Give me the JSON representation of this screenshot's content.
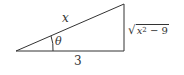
{
  "figure": {
    "type": "right-triangle",
    "labels": {
      "hypotenuse": "x",
      "angle": "θ",
      "adjacent": "3",
      "opposite_symbol": "√",
      "opposite_base": "x",
      "opposite_exp": "2",
      "opposite_rest": " − 9"
    },
    "colors": {
      "stroke": "#333333",
      "background": "#ffffff"
    }
  }
}
